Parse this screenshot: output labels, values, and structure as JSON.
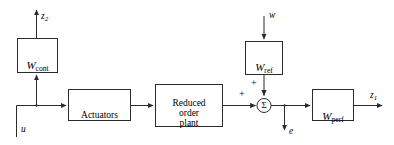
{
  "figure": {
    "type": "block-diagram",
    "stroke_color": "#2b2b2b",
    "background_color": "#ffffff"
  },
  "blocks": [
    {
      "id": "w-cont",
      "label": "W",
      "subscript": "cont",
      "kind": "weight"
    },
    {
      "id": "actuators",
      "label": "Actuators",
      "subscript": "",
      "kind": "plain"
    },
    {
      "id": "reduced-order-plant",
      "label": "Reduced\norder\nplant",
      "subscript": "",
      "kind": "plain"
    },
    {
      "id": "w-ref",
      "label": "W",
      "subscript": "ref",
      "kind": "weight"
    },
    {
      "id": "w-perf",
      "label": "W",
      "subscript": "perf",
      "kind": "weight"
    }
  ],
  "summing_junction": {
    "symbol": "Σ",
    "sign_left": "+",
    "sign_top": "+"
  },
  "signals": {
    "z2": {
      "base": "z",
      "subscript": "2"
    },
    "z1": {
      "base": "z",
      "subscript": "1"
    },
    "u": {
      "base": "u",
      "subscript": ""
    },
    "w": {
      "base": "w",
      "subscript": ""
    },
    "e": {
      "base": "e",
      "subscript": ""
    }
  }
}
